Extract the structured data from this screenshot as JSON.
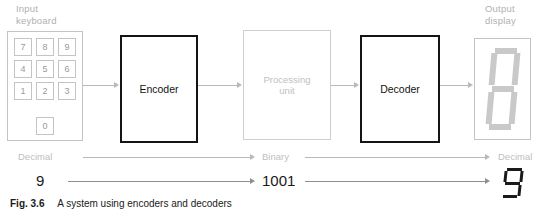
{
  "figure": {
    "caption_label": "Fig. 3.6",
    "caption_text": "A system using encoders and decoders"
  },
  "labels": {
    "input_keyboard": "Input\nkeyboard",
    "output_display": "Output\ndisplay"
  },
  "keypad": {
    "keys": [
      "7",
      "8",
      "9",
      "4",
      "5",
      "6",
      "1",
      "2",
      "3"
    ],
    "zero_key": "0"
  },
  "blocks": {
    "encoder": "Encoder",
    "processing_unit": "Processing\nunit",
    "decoder": "Decoder"
  },
  "signal_row": {
    "input_label": "Decimal",
    "middle_label": "Binary",
    "output_label": "Decimal"
  },
  "value_row": {
    "input_value": "9",
    "middle_value": "1001",
    "output_value": "9"
  },
  "display": {
    "segments_on": [
      "a",
      "b",
      "c",
      "d",
      "e",
      "f",
      "g"
    ],
    "glyph": "8"
  },
  "output_glyph": {
    "segments_on": [
      "a",
      "b",
      "c",
      "d",
      "f",
      "g"
    ],
    "glyph": "9"
  },
  "colors": {
    "ghost_gray": "#c0c0c0",
    "border_gray": "#c4c4c4",
    "solid_black": "#141414",
    "connector_gray": "#b9b9b9"
  }
}
